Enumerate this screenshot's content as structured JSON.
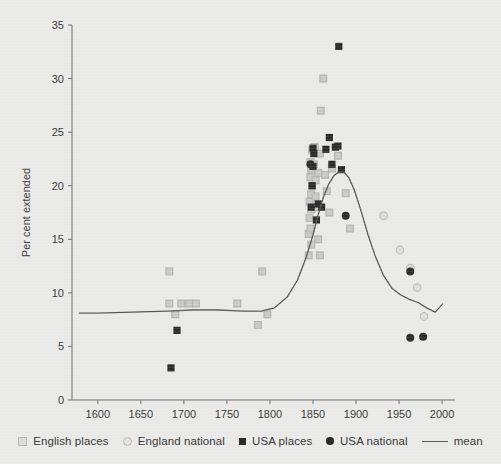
{
  "figure": {
    "background_color": "#e9e9e7",
    "plot_area": {
      "left": 72,
      "top": 25,
      "right": 455,
      "bottom": 400
    }
  },
  "chart_data": {
    "type": "scatter",
    "title": "",
    "xlabel": "",
    "ylabel": "Per cent extended",
    "xlim": [
      1570,
      2015
    ],
    "ylim": [
      0,
      35
    ],
    "xticks": [
      1600,
      1650,
      1700,
      1750,
      1800,
      1850,
      1900,
      1950,
      2000
    ],
    "yticks": [
      0,
      5,
      10,
      15,
      20,
      25,
      30,
      35
    ],
    "grid": false,
    "legend_position": "bottom",
    "series": [
      {
        "name": "English places",
        "marker": "open-square",
        "color": "#c9c9c6",
        "edge_color": "#b3b3b0",
        "points": [
          [
            1683,
            9.0
          ],
          [
            1697,
            9.0
          ],
          [
            1706,
            9.0
          ],
          [
            1714,
            9.0
          ],
          [
            1690,
            8.0
          ],
          [
            1683,
            12.0
          ],
          [
            1762,
            9.0
          ],
          [
            1786,
            7.0
          ],
          [
            1791,
            12.0
          ],
          [
            1797,
            8.0
          ],
          [
            1845,
            13.5
          ],
          [
            1848,
            14.5
          ],
          [
            1845,
            15.5
          ],
          [
            1847,
            16.0
          ],
          [
            1846,
            17.0
          ],
          [
            1848,
            17.8
          ],
          [
            1846,
            18.5
          ],
          [
            1848,
            19.2
          ],
          [
            1849,
            20.0
          ],
          [
            1847,
            20.8
          ],
          [
            1848,
            21.5
          ],
          [
            1847,
            22.2
          ],
          [
            1849,
            23.3
          ],
          [
            1852,
            23.6
          ],
          [
            1851,
            22.0
          ],
          [
            1853,
            20.5
          ],
          [
            1853,
            19.0
          ],
          [
            1854,
            18.0
          ],
          [
            1856,
            21.2
          ],
          [
            1858,
            23.0
          ],
          [
            1859,
            27.0
          ],
          [
            1862,
            30.0
          ],
          [
            1856,
            15.0
          ],
          [
            1858,
            13.5
          ],
          [
            1864,
            21.0
          ],
          [
            1866,
            19.5
          ],
          [
            1869,
            17.5
          ],
          [
            1872,
            21.6
          ],
          [
            1879,
            22.8
          ],
          [
            1888,
            19.3
          ],
          [
            1893,
            16.0
          ]
        ]
      },
      {
        "name": "England national",
        "marker": "open-circle",
        "color": "#dcdcda",
        "edge_color": "#bdbdba",
        "points": [
          [
            1932,
            17.2
          ],
          [
            1951,
            14.0
          ],
          [
            1963,
            12.3
          ],
          [
            1971,
            10.5
          ],
          [
            1979,
            7.8
          ]
        ]
      },
      {
        "name": "USA places",
        "marker": "filled-square",
        "color": "#2b2b2b",
        "points": [
          [
            1685,
            3.0
          ],
          [
            1692,
            6.5
          ],
          [
            1848,
            18.0
          ],
          [
            1849,
            20.0
          ],
          [
            1850,
            21.8
          ],
          [
            1850,
            23.5
          ],
          [
            1851,
            23.0
          ],
          [
            1854,
            16.8
          ],
          [
            1856,
            18.3
          ],
          [
            1860,
            18.0
          ],
          [
            1865,
            23.4
          ],
          [
            1869,
            24.5
          ],
          [
            1872,
            22.0
          ],
          [
            1876,
            23.6
          ],
          [
            1879,
            23.7
          ],
          [
            1880,
            33.0
          ],
          [
            1883,
            21.5
          ]
        ]
      },
      {
        "name": "USA national",
        "marker": "filled-circle",
        "color": "#2b2b2b",
        "points": [
          [
            1847,
            22.0
          ],
          [
            1888,
            17.2
          ],
          [
            1963,
            12.0
          ],
          [
            1963,
            5.8
          ],
          [
            1978,
            5.9
          ]
        ]
      },
      {
        "name": "mean",
        "marker": "line",
        "color": "#575757",
        "line": [
          [
            1578,
            8.1
          ],
          [
            1600,
            8.1
          ],
          [
            1640,
            8.2
          ],
          [
            1680,
            8.3
          ],
          [
            1710,
            8.4
          ],
          [
            1740,
            8.4
          ],
          [
            1770,
            8.3
          ],
          [
            1790,
            8.3
          ],
          [
            1805,
            8.6
          ],
          [
            1820,
            9.6
          ],
          [
            1832,
            11.2
          ],
          [
            1842,
            13.3
          ],
          [
            1850,
            15.4
          ],
          [
            1856,
            17.3
          ],
          [
            1862,
            18.9
          ],
          [
            1868,
            20.1
          ],
          [
            1874,
            20.9
          ],
          [
            1880,
            21.3
          ],
          [
            1886,
            21.3
          ],
          [
            1892,
            20.7
          ],
          [
            1898,
            19.6
          ],
          [
            1906,
            17.6
          ],
          [
            1914,
            15.4
          ],
          [
            1922,
            13.5
          ],
          [
            1932,
            11.6
          ],
          [
            1942,
            10.4
          ],
          [
            1952,
            9.8
          ],
          [
            1962,
            9.4
          ],
          [
            1972,
            9.1
          ],
          [
            1982,
            8.6
          ],
          [
            1992,
            8.2
          ],
          [
            2001,
            9.0
          ]
        ]
      }
    ]
  },
  "legend": {
    "items": [
      {
        "label": "English places",
        "marker": "open-square"
      },
      {
        "label": "England national",
        "marker": "open-circle"
      },
      {
        "label": "USA places",
        "marker": "filled-square"
      },
      {
        "label": "USA national",
        "marker": "filled-circle"
      },
      {
        "label": "mean",
        "marker": "line"
      }
    ]
  }
}
